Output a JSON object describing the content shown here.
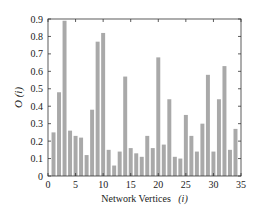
{
  "chart_data": {
    "type": "bar",
    "title": "",
    "xlabel": "Network Vertices",
    "xlabel_var": "(i)",
    "ylabel": "O (i)",
    "xlim": [
      0,
      35
    ],
    "ylim": [
      0,
      0.9
    ],
    "xticks": [
      0,
      5,
      10,
      15,
      20,
      25,
      30,
      35
    ],
    "yticks": [
      0,
      0.1,
      0.2,
      0.3,
      0.4,
      0.5,
      0.6,
      0.7,
      0.8,
      0.9
    ],
    "ytick_labels": [
      "0",
      "0.1",
      "0.2",
      "0.3",
      "0.4",
      "0.5",
      "0.6",
      "0.7",
      "0.8",
      "0.9"
    ],
    "grid": false,
    "bar_color": "#a9a9a9",
    "categories": [
      1,
      2,
      3,
      4,
      5,
      6,
      7,
      8,
      9,
      10,
      11,
      12,
      13,
      14,
      15,
      16,
      17,
      18,
      19,
      20,
      21,
      22,
      23,
      24,
      25,
      26,
      27,
      28,
      29,
      30,
      31,
      32,
      33,
      34
    ],
    "values": [
      0.25,
      0.48,
      0.89,
      0.26,
      0.23,
      0.22,
      0.12,
      0.38,
      0.77,
      0.82,
      0.15,
      0.06,
      0.14,
      0.57,
      0.16,
      0.13,
      0.11,
      0.23,
      0.16,
      0.68,
      0.18,
      0.44,
      0.11,
      0.1,
      0.35,
      0.23,
      0.14,
      0.3,
      0.58,
      0.14,
      0.44,
      0.63,
      0.15,
      0.27
    ]
  }
}
